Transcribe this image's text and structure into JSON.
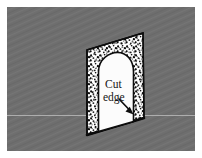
{
  "figure": {
    "name": "cut-edge-wall-panel-diagram",
    "background_color": "#6e6e6e",
    "border_color": "#ffffff",
    "panel_fill_color": "#ffffff",
    "panel_texture": "stipple-speckle",
    "opening_fill_color": "#fcfcfc",
    "outline_color": "#0d0d0d",
    "horizon_line_color": "#b9b9b9"
  },
  "annotation": {
    "line1": "Cut",
    "line2": "edge",
    "full_label": "Cut edge",
    "pointer": "arrow"
  }
}
